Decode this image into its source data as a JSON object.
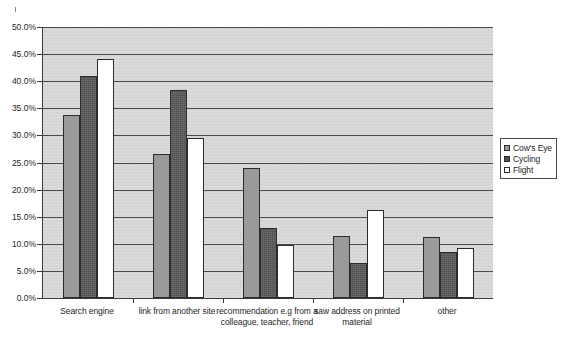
{
  "chart_data": {
    "type": "bar",
    "title": "",
    "subtitle": "",
    "xlabel": "",
    "ylabel": "",
    "ylim": [
      0,
      0.5
    ],
    "grid": true,
    "legend_position": "right",
    "y_ticks": [
      "0.0%",
      "5.0%",
      "10.0%",
      "15.0%",
      "20.0%",
      "25.0%",
      "30.0%",
      "35.0%",
      "40.0%",
      "45.0%",
      "50.0%"
    ],
    "y_tick_values": [
      0,
      5,
      10,
      15,
      20,
      25,
      30,
      35,
      40,
      45,
      50
    ],
    "categories": [
      "Search engine",
      "link from another site",
      "recommendation e.g from a colleague, teacher, friend",
      "saw address on printed material",
      "other"
    ],
    "series": [
      {
        "name": "Cow's Eye",
        "color": "#9a9a9a",
        "values": [
          33.8,
          26.6,
          24.0,
          11.4,
          11.3
        ]
      },
      {
        "name": "Cycling",
        "color": "#4f4f4f",
        "values": [
          41.0,
          38.4,
          13.0,
          6.4,
          8.4
        ]
      },
      {
        "name": "Flight",
        "color": "#ffffff",
        "values": [
          44.1,
          29.5,
          9.7,
          16.3,
          9.3
        ]
      }
    ]
  },
  "legend": {
    "items": [
      {
        "label": "Cow's Eye"
      },
      {
        "label": "Cycling"
      },
      {
        "label": "Flight"
      }
    ]
  }
}
